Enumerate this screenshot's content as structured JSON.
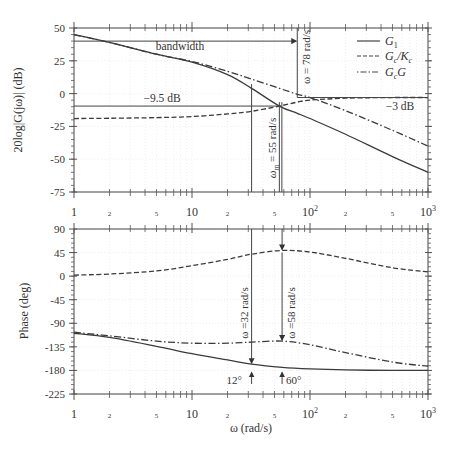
{
  "chart_data": [
    {
      "type": "line",
      "panel": "magnitude",
      "ylabel": "20log|G(jω)| (dB)",
      "xlabel": "",
      "xscale": "log",
      "xlim": [
        1,
        1000
      ],
      "ylim": [
        -75,
        50
      ],
      "yticks": [
        50,
        25,
        0,
        -25,
        -50,
        -75
      ],
      "xticklabels": [
        "1",
        "2",
        "5",
        "10",
        "2",
        "5",
        "10²",
        "2",
        "5",
        "10³"
      ],
      "grid": true,
      "legend": {
        "position": "upper right",
        "entries": [
          "G1",
          "Gc/Kc",
          "GcG"
        ]
      },
      "x": [
        1,
        2,
        5,
        10,
        20,
        32,
        55,
        78,
        100,
        200,
        500,
        1000
      ],
      "series": [
        {
          "name": "G1",
          "style": "solid",
          "values": [
            45,
            39,
            30,
            24,
            14.5,
            4,
            -9.5,
            -15,
            -19,
            -31,
            -48,
            -60
          ]
        },
        {
          "name": "Gc/Kc",
          "style": "dashed",
          "values": [
            -19,
            -18.8,
            -18.3,
            -17.5,
            -15.5,
            -13.5,
            -9.5,
            -6.5,
            -5,
            -3.5,
            -3,
            -3
          ]
        },
        {
          "name": "GcG",
          "style": "dashdot",
          "values": [
            45,
            39,
            30,
            24.5,
            17,
            11,
            4,
            -0.5,
            -3,
            -13,
            -28,
            -40
          ]
        }
      ],
      "annotations": [
        {
          "text": "bandwidth",
          "type": "arrow",
          "from_x": 1,
          "to_x": 78,
          "y": 40
        },
        {
          "text": "ω = 78 rad/s",
          "type": "vertical-line",
          "x": 78
        },
        {
          "text": "−9.5 dB",
          "type": "horizontal-line",
          "y": -9.5
        },
        {
          "text": "−3 dB",
          "type": "horizontal-line",
          "y": -3
        },
        {
          "text": "ωm = 55 rad/s",
          "type": "vertical-line",
          "x": 55
        }
      ]
    },
    {
      "type": "line",
      "panel": "phase",
      "ylabel": "Phase (deg)",
      "xlabel": "ω (rad/s)",
      "xscale": "log",
      "xlim": [
        1,
        1000
      ],
      "ylim": [
        -225,
        90
      ],
      "yticks": [
        90,
        45,
        0,
        -45,
        -90,
        -135,
        -180,
        -225
      ],
      "xticklabels": [
        "1",
        "2",
        "5",
        "10",
        "2",
        "5",
        "10²",
        "2",
        "5",
        "10³"
      ],
      "grid": true,
      "x": [
        1,
        2,
        5,
        10,
        20,
        32,
        58,
        100,
        200,
        500,
        1000
      ],
      "series": [
        {
          "name": "G1",
          "style": "solid",
          "values": [
            -109,
            -117,
            -134,
            -148,
            -160,
            -168,
            -174,
            -177,
            -179,
            -180,
            -180
          ]
        },
        {
          "name": "Gc/Kc",
          "style": "dashed",
          "values": [
            2,
            4,
            10,
            20,
            32,
            42,
            49,
            46,
            34,
            16,
            8
          ]
        },
        {
          "name": "GcG",
          "style": "dashdot",
          "values": [
            -107,
            -114,
            -124,
            -128,
            -128,
            -126,
            -124,
            -131,
            -146,
            -164,
            -172
          ]
        }
      ],
      "annotations": [
        {
          "text": "ω =32 rad/s",
          "type": "arrow-down",
          "x": 32
        },
        {
          "text": "ω =58 rad/s",
          "type": "arrow-down",
          "x": 58
        },
        {
          "text": "12°",
          "type": "arrow-up",
          "x": 32
        },
        {
          "text": "60°",
          "type": "arrow-up",
          "x": 58
        }
      ]
    }
  ],
  "labels": {
    "mag_ylabel": "20log|G(jω)| (dB)",
    "phase_ylabel": "Phase (deg)",
    "xlabel": "ω (rad/s)",
    "bandwidth": "bandwidth",
    "w78": "ω = 78 rad/s",
    "m95": "−9.5 dB",
    "m3": "−3 dB",
    "wm55": "= 55 rad/s",
    "w32": "ω =32 rad/s",
    "w58": "ω =58 rad/s",
    "deg12": "12°",
    "deg60": "60°",
    "legend_g1": "G",
    "legend_gckc": "G",
    "legend_gcg": "G"
  }
}
